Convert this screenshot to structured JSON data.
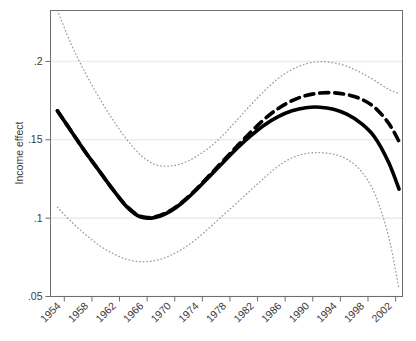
{
  "chart_data": {
    "type": "line",
    "title": "",
    "subtitle": "",
    "xlabel": "",
    "ylabel": "Income effect",
    "xlim": [
      1952,
      2003
    ],
    "ylim": [
      0.05,
      0.2325
    ],
    "grid": true,
    "grid_axis": "y",
    "legend": "none",
    "y_ticks": [
      ".05",
      ".1",
      ".15",
      ".2"
    ],
    "y_tick_values": [
      0.05,
      0.1,
      0.15,
      0.2
    ],
    "x_ticks": [
      "1954",
      "1958",
      "1962",
      "1966",
      "1970",
      "1974",
      "1978",
      "1982",
      "1986",
      "1990",
      "1994",
      "1998",
      "2002"
    ],
    "x_tick_values": [
      1954,
      1958,
      1962,
      1966,
      1970,
      1974,
      1978,
      1982,
      1986,
      1990,
      1994,
      1998,
      2002
    ],
    "x": [
      1953,
      1955,
      1957,
      1959,
      1961,
      1963,
      1965,
      1967,
      1969,
      1971,
      1973,
      1975,
      1977,
      1979,
      1981,
      1983,
      1985,
      1987,
      1989,
      1991,
      1993,
      1995,
      1997,
      1999,
      2001,
      2002.5
    ],
    "series": [
      {
        "name": "estimate-solid",
        "style": "solid",
        "color": "#000000",
        "width": 3.6,
        "values": [
          0.1685,
          0.1555,
          0.1425,
          0.1305,
          0.1185,
          0.1075,
          0.1008,
          0.1003,
          0.1035,
          0.1095,
          0.1175,
          0.1265,
          0.1355,
          0.1445,
          0.1525,
          0.1595,
          0.1648,
          0.1685,
          0.1705,
          0.1708,
          0.1695,
          0.1662,
          0.1605,
          0.1515,
          0.1355,
          0.1185
        ]
      },
      {
        "name": "estimate-dashed",
        "style": "dashed",
        "color": "#000000",
        "width": 3.6,
        "values": [
          0.1685,
          0.1555,
          0.1425,
          0.1305,
          0.1185,
          0.1078,
          0.1012,
          0.1008,
          0.104,
          0.11,
          0.118,
          0.1272,
          0.1365,
          0.1458,
          0.1548,
          0.1632,
          0.17,
          0.175,
          0.1782,
          0.1798,
          0.18,
          0.1788,
          0.176,
          0.1705,
          0.1605,
          0.149
        ]
      },
      {
        "name": "upper-confidence-band",
        "style": "dotted",
        "color": "#9a9a9a",
        "width": 1.3,
        "values": [
          0.2325,
          0.211,
          0.193,
          0.1772,
          0.163,
          0.1505,
          0.1405,
          0.1345,
          0.1332,
          0.1348,
          0.139,
          0.145,
          0.153,
          0.1625,
          0.1722,
          0.1812,
          0.1892,
          0.1948,
          0.1985,
          0.1998,
          0.1992,
          0.1968,
          0.1928,
          0.1878,
          0.1822,
          0.1795
        ]
      },
      {
        "name": "lower-confidence-band",
        "style": "dotted",
        "color": "#9a9a9a",
        "width": 1.3,
        "values": [
          0.107,
          0.0978,
          0.0898,
          0.0828,
          0.0775,
          0.0738,
          0.0722,
          0.0728,
          0.0755,
          0.08,
          0.0862,
          0.0938,
          0.1018,
          0.1098,
          0.1178,
          0.1258,
          0.1332,
          0.1385,
          0.1412,
          0.1418,
          0.1408,
          0.1375,
          0.13,
          0.1155,
          0.088,
          0.0548
        ]
      }
    ]
  },
  "axis": {
    "y_title": "Income effect"
  },
  "colors": {
    "frame": "#6e6e6e",
    "grid": "#ececec",
    "line": "#000000",
    "band": "#9a9a9a",
    "text": "#3b3b3b",
    "background": "#ffffff"
  }
}
